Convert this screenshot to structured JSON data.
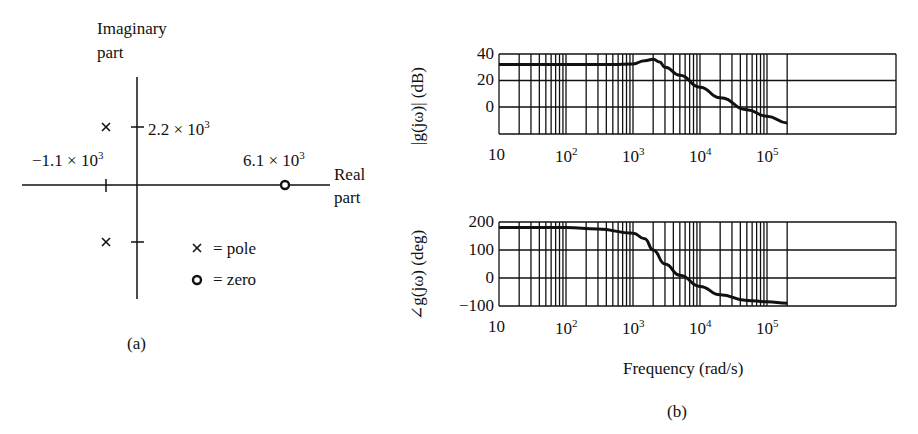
{
  "panel_a": {
    "caption": "(a)",
    "imag_axis_label_1": "Imaginary",
    "imag_axis_label_2": "part",
    "real_axis_label_1": "Real",
    "real_axis_label_2": "part",
    "imag_tick_label": "2.2 × 10",
    "imag_tick_exp": "3",
    "real_pole_label": "−1.1 × 10",
    "real_pole_exp": "3",
    "zero_label": "6.1 × 10",
    "zero_exp": "3",
    "legend": [
      {
        "symbol": "×",
        "text": "= pole"
      },
      {
        "symbol": "o",
        "text": "= zero"
      }
    ]
  },
  "panel_b": {
    "caption": "(b)",
    "xlabel": "Frequency (rad/s)",
    "mag_ylabel": "|g(jω)| (dB)",
    "phase_ylabel": "∠g(jω) (deg)",
    "x_ticks": [
      {
        "base": "10",
        "exp": ""
      },
      {
        "base": "10",
        "exp": "2"
      },
      {
        "base": "10",
        "exp": "3"
      },
      {
        "base": "10",
        "exp": "4"
      },
      {
        "base": "10",
        "exp": "5"
      }
    ],
    "mag_yticks": [
      "40",
      "20",
      "0"
    ],
    "phase_yticks": [
      "200",
      "100",
      "0",
      "−100"
    ]
  },
  "chart_data": [
    {
      "type": "scatter",
      "title": "Pole-zero plot (a)",
      "xlabel": "Real part",
      "ylabel": "Imaginary part",
      "poles": [
        [
          -1100,
          2200
        ],
        [
          -1100,
          -2200
        ]
      ],
      "zeros": [
        [
          6100,
          0
        ]
      ]
    },
    {
      "type": "line",
      "title": "Bode magnitude",
      "xscale": "log",
      "xlabel": "Frequency (rad/s)",
      "ylabel": "|g(jω)| (dB)",
      "xlim": [
        10,
        200000
      ],
      "ylim": [
        -20,
        40
      ],
      "grid": true,
      "x": [
        10,
        100,
        500,
        1000,
        1500,
        2000,
        2500,
        3000,
        5000,
        10000,
        20000,
        50000,
        100000,
        200000
      ],
      "values": [
        32,
        32,
        32,
        32.5,
        35,
        36,
        34,
        30,
        24,
        15,
        7,
        -2,
        -7,
        -12
      ]
    },
    {
      "type": "line",
      "title": "Bode phase",
      "xscale": "log",
      "xlabel": "Frequency (rad/s)",
      "ylabel": "∠g(jω) (deg)",
      "xlim": [
        10,
        200000
      ],
      "ylim": [
        -100,
        200
      ],
      "grid": true,
      "x": [
        10,
        100,
        300,
        1000,
        1500,
        2000,
        3000,
        5000,
        10000,
        20000,
        50000,
        100000,
        200000
      ],
      "values": [
        180,
        180,
        175,
        160,
        140,
        100,
        50,
        10,
        -30,
        -60,
        -80,
        -85,
        -90
      ]
    }
  ]
}
